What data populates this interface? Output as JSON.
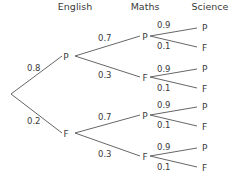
{
  "headers": [
    "English",
    "Maths",
    "Science"
  ],
  "english": [
    {
      "outcome": "P",
      "prob": "0.8"
    },
    {
      "outcome": "F",
      "prob": "0.2"
    }
  ],
  "maths": [
    {
      "outcome": "P",
      "prob": "0.7"
    },
    {
      "outcome": "F",
      "prob": "0.3"
    },
    {
      "outcome": "P",
      "prob": "0.7"
    },
    {
      "outcome": "F",
      "prob": "0.3"
    }
  ],
  "science": [
    {
      "outcome": "P",
      "prob": "0.9"
    },
    {
      "outcome": "F",
      "prob": "0.1"
    },
    {
      "outcome": "P",
      "prob": "0.9"
    },
    {
      "outcome": "F",
      "prob": "0.1"
    },
    {
      "outcome": "P",
      "prob": "0.9"
    },
    {
      "outcome": "F",
      "prob": "0.1"
    },
    {
      "outcome": "P",
      "prob": "0.9"
    },
    {
      "outcome": "F",
      "prob": "0.1"
    }
  ]
}
